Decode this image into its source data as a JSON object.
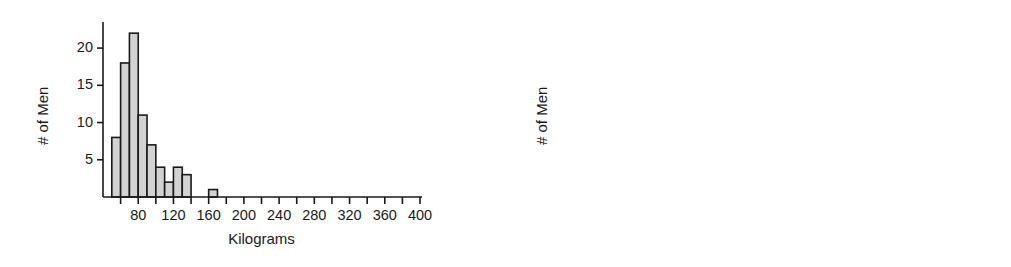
{
  "figure": {
    "background": "#ffffff",
    "bar_fill": "#d2d2d2",
    "bar_stroke": "#1a1a1a",
    "axis_color": "#1a1a1a"
  },
  "chart_data": [
    {
      "type": "bar",
      "id": "kilograms-histogram",
      "title": "",
      "xlabel": "Kilograms",
      "ylabel": "# of Men",
      "xlim": [
        40,
        400
      ],
      "ylim": [
        0,
        23.5
      ],
      "grid": false,
      "legend": null,
      "bin_width": 10,
      "xticks_major": [
        80,
        120,
        160,
        200,
        240,
        280,
        320,
        360,
        400
      ],
      "xticks_minor": [
        60,
        100,
        140,
        180,
        220,
        260,
        300,
        340,
        380
      ],
      "xticklabels": [
        "80",
        "120",
        "160",
        "200",
        "240",
        "280",
        "320",
        "360",
        "400"
      ],
      "yticks": [
        5,
        10,
        15,
        20
      ],
      "yticklabels": [
        "5",
        "10",
        "15",
        "20"
      ],
      "bins": [
        {
          "x0": 50,
          "x1": 60,
          "value": 8
        },
        {
          "x0": 60,
          "x1": 70,
          "value": 18
        },
        {
          "x0": 70,
          "x1": 80,
          "value": 22
        },
        {
          "x0": 80,
          "x1": 90,
          "value": 11
        },
        {
          "x0": 90,
          "x1": 100,
          "value": 7
        },
        {
          "x0": 100,
          "x1": 110,
          "value": 4
        },
        {
          "x0": 110,
          "x1": 120,
          "value": 2
        },
        {
          "x0": 120,
          "x1": 130,
          "value": 4
        },
        {
          "x0": 130,
          "x1": 140,
          "value": 3
        },
        {
          "x0": 160,
          "x1": 170,
          "value": 1
        }
      ],
      "categories": [
        "50-60",
        "60-70",
        "70-80",
        "80-90",
        "90-100",
        "100-110",
        "110-120",
        "120-130",
        "130-140",
        "160-170"
      ],
      "values": [
        8,
        18,
        22,
        11,
        7,
        4,
        2,
        4,
        3,
        1
      ]
    },
    {
      "type": "bar",
      "id": "pounds-histogram",
      "title": "",
      "xlabel": "Pounds",
      "ylabel": "# of Men",
      "xlim": [
        60,
        420
      ],
      "ylim": [
        0,
        23.5
      ],
      "grid": false,
      "legend": null,
      "bin_width": 20,
      "xticks_major": [
        80,
        120,
        160,
        200,
        240,
        280,
        320,
        360,
        400
      ],
      "xticks_minor": [
        100,
        140,
        180,
        220,
        260,
        300,
        340,
        380,
        420
      ],
      "xticklabels": [
        "80",
        "120",
        "160",
        "200",
        "240",
        "280",
        "320",
        "360",
        "400"
      ],
      "yticks": [
        5,
        10,
        15,
        20
      ],
      "yticklabels": [
        "5",
        "10",
        "15",
        "20"
      ],
      "bins": [
        {
          "x0": 110,
          "x1": 130,
          "value": 7
        },
        {
          "x0": 130,
          "x1": 150,
          "value": 14
        },
        {
          "x0": 150,
          "x1": 170,
          "value": 20.5
        },
        {
          "x0": 170,
          "x1": 190,
          "value": 17
        },
        {
          "x0": 190,
          "x1": 210,
          "value": 5
        },
        {
          "x0": 210,
          "x1": 230,
          "value": 3.5
        },
        {
          "x0": 230,
          "x1": 250,
          "value": 2.5
        },
        {
          "x0": 250,
          "x1": 270,
          "value": 1.5
        },
        {
          "x0": 270,
          "x1": 290,
          "value": 5.7
        },
        {
          "x0": 290,
          "x1": 310,
          "value": 1
        },
        {
          "x0": 355,
          "x1": 375,
          "value": 1
        }
      ],
      "categories": [
        "110-130",
        "130-150",
        "150-170",
        "170-190",
        "190-210",
        "210-230",
        "230-250",
        "250-270",
        "270-290",
        "290-310",
        "355-375"
      ],
      "values": [
        7,
        14,
        20.5,
        17,
        5,
        3.5,
        2.5,
        1.5,
        5.7,
        1,
        1
      ]
    }
  ]
}
